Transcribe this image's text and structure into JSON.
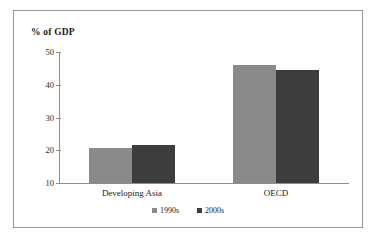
{
  "chart_data": {
    "type": "bar",
    "title": "",
    "subtitle": "",
    "xlabel": "",
    "ylabel": "% of GDP",
    "ylim": [
      10,
      50
    ],
    "yticks": [
      "10",
      "20",
      "30",
      "40",
      "50"
    ],
    "grid": false,
    "legend_position": "bottom",
    "categories": [
      "Developing Asia",
      "OECD"
    ],
    "series": [
      {
        "name": "1990s",
        "color": "#8a8a8a",
        "values": [
          20.8,
          46.0
        ]
      },
      {
        "name": "2000s",
        "color": "#3d3d3d",
        "values": [
          21.5,
          44.5
        ]
      }
    ]
  },
  "axis": {
    "y_title": "% of GDP",
    "ticks": [
      {
        "label": "50",
        "value": 50
      },
      {
        "label": "40",
        "value": 40
      },
      {
        "label": "30",
        "value": 30
      },
      {
        "label": "20",
        "value": 20
      },
      {
        "label": "10",
        "value": 10
      }
    ]
  },
  "categories": [
    {
      "label": "Developing Asia"
    },
    {
      "label": "OECD"
    }
  ],
  "legend": {
    "items": [
      {
        "label": "1990s",
        "color": "#8a8a8a"
      },
      {
        "label": "2000s",
        "color": "#3d3d3d"
      }
    ]
  },
  "colors": {
    "series_1990s": "#8a8a8a",
    "series_2000s": "#3d3d3d",
    "axis": "#8e8e8e",
    "frame": "#9a9a9a",
    "background": "#ffffff"
  }
}
